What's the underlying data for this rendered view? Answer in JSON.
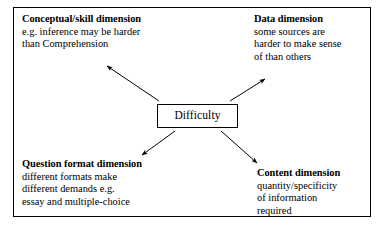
{
  "diagram": {
    "type": "radial-concept-map",
    "central_node": {
      "label": "Difficulty"
    },
    "dimensions": [
      {
        "id": "conceptual",
        "heading": "Conceptual/skill dimension",
        "lines": [
          "e.g. inference may be harder",
          "than Comprehension"
        ],
        "position": "top-left"
      },
      {
        "id": "data",
        "heading": "Data dimension",
        "lines": [
          "some sources are",
          "harder to make sense",
          "of than others"
        ],
        "position": "top-right"
      },
      {
        "id": "question-format",
        "heading": "Question format dimension",
        "lines": [
          "different formats make",
          "different demands e.g.",
          "essay and multiple-choice"
        ],
        "position": "bottom-left"
      },
      {
        "id": "content",
        "heading": "Content dimension",
        "lines": [
          "quantity/specificity",
          "of information",
          "required"
        ],
        "position": "bottom-right"
      }
    ],
    "connectors": [
      {
        "id": "arrow-to-conceptual",
        "from": "central-node",
        "to": "conceptual",
        "direction": "up-left"
      },
      {
        "id": "arrow-to-data",
        "from": "central-node",
        "to": "data",
        "direction": "up-right"
      },
      {
        "id": "arrow-to-question-format",
        "from": "central-node",
        "to": "question-format",
        "direction": "down-left"
      },
      {
        "id": "arrow-to-content",
        "from": "central-node",
        "to": "content",
        "direction": "down-right"
      }
    ],
    "colors": {
      "stroke": "#000000",
      "background": "#ffffff",
      "text": "#000000"
    }
  }
}
